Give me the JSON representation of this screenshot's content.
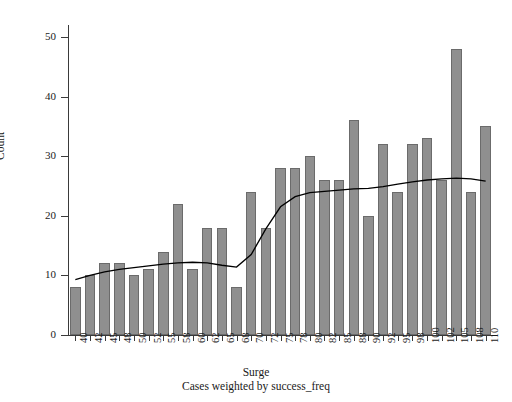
{
  "chart_data": {
    "type": "bar",
    "title": "",
    "subtitle": "",
    "xlabel": "Surge",
    "ylabel": "Count",
    "footnote": "Cases weighted by success_freq",
    "categories": [
      "40",
      "42",
      "45",
      "48",
      "50",
      "52",
      "55",
      "58",
      "60",
      "62",
      "65",
      "68",
      "70",
      "72",
      "75",
      "78",
      "80",
      "82",
      "85",
      "88",
      "90",
      "92",
      "95",
      "98",
      "100",
      "102",
      "105",
      "108",
      "110"
    ],
    "values": [
      8,
      10,
      12,
      12,
      10,
      11,
      14,
      22,
      11,
      18,
      18,
      8,
      24,
      18,
      28,
      28,
      30,
      26,
      26,
      36,
      20,
      32,
      24,
      32,
      33,
      26,
      48,
      24,
      35
    ],
    "ylim": [
      0,
      52
    ],
    "yticks": [
      0,
      10,
      20,
      30,
      40,
      50
    ],
    "ytick_labels": [
      "0",
      "10",
      "20",
      "30",
      "40",
      "50"
    ],
    "grid": false,
    "legend": "none",
    "bar_color": "#8f8f8f",
    "bar_edge_color": "#6b6b6b",
    "axis_color": "#3a3a3a",
    "series": [
      {
        "name": "Count",
        "values": [
          8,
          10,
          12,
          12,
          10,
          11,
          14,
          22,
          11,
          18,
          18,
          8,
          24,
          18,
          28,
          28,
          30,
          26,
          26,
          36,
          20,
          32,
          24,
          32,
          33,
          26,
          48,
          24,
          35
        ]
      },
      {
        "name": "fit-curve",
        "type": "line",
        "color": "#000000",
        "values": [
          9.3,
          10.0,
          10.6,
          11.0,
          11.3,
          11.6,
          11.9,
          12.1,
          12.2,
          12.1,
          11.7,
          11.4,
          13.5,
          17.8,
          21.5,
          23.2,
          23.9,
          24.1,
          24.3,
          24.5,
          24.6,
          24.9,
          25.3,
          25.7,
          26.0,
          26.2,
          26.3,
          26.2,
          25.8
        ]
      }
    ]
  },
  "axis": {
    "y_title": "Count",
    "x_title": "Surge",
    "weight_note": "Cases weighted by success_freq"
  }
}
